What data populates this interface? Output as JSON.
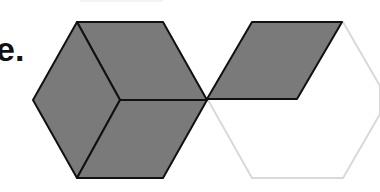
{
  "text_fragment": "e.",
  "figure": {
    "fill_color": "#7a7a7a",
    "stroke_color": "#111111",
    "light_stroke_color": "#d9d9d9"
  }
}
